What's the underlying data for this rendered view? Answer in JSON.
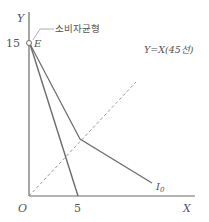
{
  "diagram": {
    "type": "indifference-curve-diagram",
    "axes": {
      "x_label": "X",
      "y_label": "Y",
      "origin_label": "O"
    },
    "ticks": {
      "y_intercept": "15",
      "x_intercept": "5"
    },
    "points": {
      "equilibrium_label": "E",
      "equilibrium_annotation": "소비자균형"
    },
    "lines": {
      "diagonal_label": "Y=X(45선)",
      "indifference_curve_label": "I",
      "indifference_curve_subscript": "0"
    },
    "colors": {
      "line": "#6b6b6b",
      "text": "#555555",
      "dashed": "#8a8a8a"
    }
  }
}
